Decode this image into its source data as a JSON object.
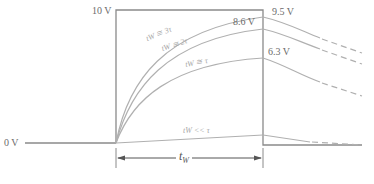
{
  "diagram": {
    "labels": {
      "top_voltage": "10 V",
      "zero_voltage": "0 V",
      "curve_3tau_end": "9.5 V",
      "curve_2tau_end": "8.6 V",
      "curve_tau_end": "6.3 V"
    },
    "curves": [
      {
        "label": "tW ≅ 3τ",
        "end_value": "9.5 V"
      },
      {
        "label": "tW ≅ 2τ",
        "end_value": "8.6 V"
      },
      {
        "label": "tW ≅ τ",
        "end_value": "6.3 V"
      },
      {
        "label": "tW << τ",
        "end_value": ""
      }
    ],
    "pulse_width_label": "t",
    "pulse_width_sub": "W",
    "colors": {
      "pulse": "#8a8a8a",
      "curves": "#b0b0b0",
      "text": "#6b6b6b"
    }
  }
}
